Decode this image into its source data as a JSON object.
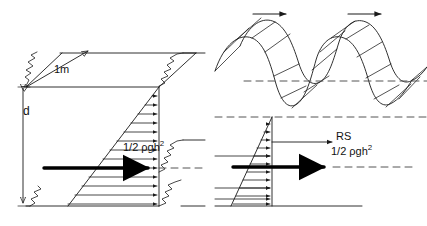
{
  "figure": {
    "background_color": "#ffffff",
    "line_color": "#1a1a1a",
    "bold_line_color": "#000000",
    "dashed_line_color": "#555555"
  },
  "labels": {
    "width_1m": "1m",
    "depth_d": "d",
    "pressure_left_prefix": "1/2 ",
    "pressure_left_rho": "ρgh",
    "pressure_left_exponent": "2",
    "pressure_left_full": "1/2 ρgh²",
    "run_up_rs": "RS",
    "pressure_right_prefix": "1/2 ",
    "pressure_right_rho": "ρgh",
    "pressure_right_exponent": "2",
    "pressure_right_full": "1/2 ρgh²"
  },
  "left_panel": {
    "name": "still-water-hydrostatic-panel",
    "description": "Vertical wall element of 1 m width, water depth d, triangular hydrostatic pressure distribution with resultant force arrow",
    "dimension_width": "1m",
    "dimension_depth": "d",
    "resultant_force": "1/2 ρgh²",
    "pressure_arrow_count": 13
  },
  "right_panel": {
    "name": "wave-pressure-panel",
    "description": "Wave crest train travelling toward the wall, still water level and crest level dashed datums, wave pressure distribution with run-up RS and resultant force arrow",
    "run_up_label": "RS",
    "resultant_force": "1/2 ρgh²",
    "wave_direction_arrows": 2,
    "pressure_arrow_count": 12
  }
}
